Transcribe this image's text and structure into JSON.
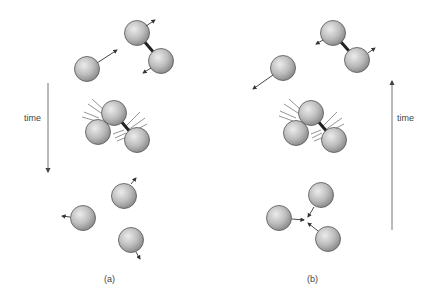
{
  "diagram": {
    "colors": {
      "ball_light": "#e6e6e6",
      "ball_dark": "#8c8c8c",
      "outline": "#555555",
      "arrow": "#333333",
      "axis": "#666666"
    },
    "panels": [
      {
        "id": "a",
        "caption": "(a)",
        "time_label": "time",
        "time_direction": "down",
        "stages": [
          "separate: single atom approaching bonded pair",
          "collision of three atoms",
          "three separate atoms flying apart"
        ]
      },
      {
        "id": "b",
        "caption": "(b)",
        "time_label": "time",
        "time_direction": "up",
        "stages": [
          "three separate atoms converging",
          "collision of three atoms",
          "single atom leaving bonded pair"
        ]
      }
    ]
  }
}
